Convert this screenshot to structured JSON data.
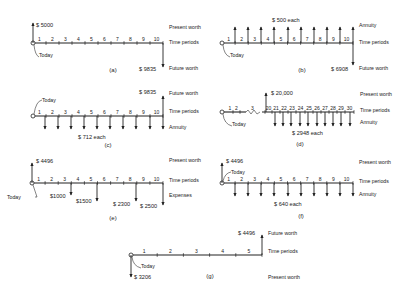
{
  "labels": {
    "present_worth": "Present worth",
    "future_worth": "Future worth",
    "time_periods": "Time periods",
    "annuity": "Annuity",
    "expenses": "Expenses",
    "today": "Today"
  },
  "diagrams": [
    {
      "id": "a",
      "caption": "(a)",
      "origin": [
        33,
        43
      ],
      "end": [
        163,
        43
      ],
      "ticks": [
        "1",
        "2",
        "3",
        "4",
        "5",
        "6",
        "7",
        "8",
        "9",
        "10"
      ],
      "arrows": [
        {
          "x": 33,
          "dir": "up",
          "len": 20,
          "label": "$ 5000",
          "lx": 36,
          "ly": 27
        },
        {
          "x": 163,
          "dir": "down",
          "len": 24,
          "label": "$ 9835",
          "lx": 139,
          "ly": 71
        }
      ],
      "right_labels": [
        {
          "text": "Present worth",
          "y": 29
        },
        {
          "text": "Time periods",
          "y": 44
        },
        {
          "text": "Future worth",
          "y": 70
        }
      ],
      "today": {
        "x": 38,
        "y": 57,
        "side": "below"
      },
      "caption_pos": [
        113,
        72
      ]
    },
    {
      "id": "b",
      "caption": "(b)",
      "origin": [
        222,
        43
      ],
      "end": [
        353,
        43
      ],
      "ticks": [
        "1",
        "2",
        "3",
        "4",
        "5",
        "6",
        "7",
        "8",
        "9",
        "10"
      ],
      "arrows": [
        {
          "x": 235,
          "dir": "up",
          "len": 16
        },
        {
          "x": 248,
          "dir": "up",
          "len": 16
        },
        {
          "x": 261,
          "dir": "up",
          "len": 16
        },
        {
          "x": 274,
          "dir": "up",
          "len": 16
        },
        {
          "x": 288,
          "dir": "up",
          "len": 16
        },
        {
          "x": 301,
          "dir": "up",
          "len": 16
        },
        {
          "x": 314,
          "dir": "up",
          "len": 16
        },
        {
          "x": 327,
          "dir": "up",
          "len": 16
        },
        {
          "x": 340,
          "dir": "up",
          "len": 16
        },
        {
          "x": 353,
          "dir": "up",
          "len": 16
        },
        {
          "x": 353,
          "dir": "down",
          "len": 22,
          "label": "$ 6908",
          "lx": 331,
          "ly": 71
        }
      ],
      "top_label": {
        "text": "$ 500 each",
        "x": 272,
        "y": 22
      },
      "right_labels": [
        {
          "text": "Annuity",
          "y": 27
        },
        {
          "text": "Time periods",
          "y": 44
        },
        {
          "text": "Future worth",
          "y": 70
        }
      ],
      "today": {
        "x": 229,
        "y": 57,
        "side": "below"
      },
      "caption_pos": [
        302,
        72
      ]
    },
    {
      "id": "c",
      "caption": "(c)",
      "origin": [
        33,
        116
      ],
      "end": [
        163,
        116
      ],
      "ticks": [
        "1",
        "2",
        "3",
        "4",
        "5",
        "6",
        "7",
        "8",
        "9",
        "10"
      ],
      "arrows": [
        {
          "x": 45,
          "dir": "down",
          "len": 13
        },
        {
          "x": 58,
          "dir": "down",
          "len": 13
        },
        {
          "x": 71,
          "dir": "down",
          "len": 13
        },
        {
          "x": 84,
          "dir": "down",
          "len": 13
        },
        {
          "x": 97,
          "dir": "down",
          "len": 13
        },
        {
          "x": 110,
          "dir": "down",
          "len": 13
        },
        {
          "x": 123,
          "dir": "down",
          "len": 13
        },
        {
          "x": 136,
          "dir": "down",
          "len": 13
        },
        {
          "x": 150,
          "dir": "down",
          "len": 13
        },
        {
          "x": 163,
          "dir": "down",
          "len": 13
        },
        {
          "x": 163,
          "dir": "up",
          "len": 20,
          "label": "$ 9835",
          "lx": 139,
          "ly": 94
        }
      ],
      "bottom_label": {
        "text": "$ 712 each",
        "x": 78,
        "y": 139
      },
      "right_labels": [
        {
          "text": "Future worth",
          "y": 95
        },
        {
          "text": "Time periods",
          "y": 113
        },
        {
          "text": "Annuity",
          "y": 129
        }
      ],
      "today": {
        "x": 43,
        "y": 101,
        "side": "above"
      },
      "caption_pos": [
        108,
        147
      ]
    },
    {
      "id": "d",
      "caption": "(d)",
      "origin": [
        222,
        112
      ],
      "end": [
        354,
        112
      ],
      "break": {
        "x1": 246,
        "x2": 262
      },
      "ticks": [
        "1",
        "2",
        "3",
        "20",
        "21",
        "22",
        "23",
        "24",
        "25",
        "26",
        "27",
        "28",
        "29",
        "30"
      ],
      "tick_x": [
        227,
        233,
        240,
        265,
        272,
        280,
        288,
        296,
        305,
        313,
        321,
        329,
        337,
        345,
        354
      ],
      "arrows": [
        {
          "x": 266,
          "dir": "up",
          "len": 19,
          "label": "$ 20,000",
          "lx": 271,
          "ly": 95
        },
        {
          "x": 275,
          "dir": "down",
          "len": 14
        },
        {
          "x": 283,
          "dir": "down",
          "len": 14
        },
        {
          "x": 291,
          "dir": "down",
          "len": 14
        },
        {
          "x": 300,
          "dir": "down",
          "len": 14
        },
        {
          "x": 308,
          "dir": "down",
          "len": 14
        },
        {
          "x": 317,
          "dir": "down",
          "len": 14
        },
        {
          "x": 325,
          "dir": "down",
          "len": 14
        },
        {
          "x": 333,
          "dir": "down",
          "len": 14
        },
        {
          "x": 341,
          "dir": "down",
          "len": 14
        },
        {
          "x": 350,
          "dir": "down",
          "len": 14
        }
      ],
      "bottom_label": {
        "text": "$ 2948 each",
        "x": 292,
        "y": 135
      },
      "right_labels": [
        {
          "text": "Present worth",
          "y": 96
        },
        {
          "text": "Time periods",
          "y": 112
        },
        {
          "text": "Annuity",
          "y": 124
        }
      ],
      "today": {
        "x": 231,
        "y": 126,
        "side": "below"
      },
      "caption_pos": [
        300,
        146
      ]
    },
    {
      "id": "e",
      "caption": "(e)",
      "origin": [
        32,
        183
      ],
      "end": [
        163,
        183
      ],
      "ticks": [
        "1",
        "2",
        "3",
        "4",
        "5",
        "6",
        "7",
        "8",
        "9",
        "10"
      ],
      "arrows": [
        {
          "x": 32,
          "dir": "up",
          "len": 20,
          "label": "$ 4496",
          "lx": 36,
          "ly": 163
        },
        {
          "x": 71,
          "dir": "down",
          "len": 12,
          "label": "$1000",
          "lx": 50,
          "ly": 198
        },
        {
          "x": 97,
          "dir": "down",
          "len": 18,
          "label": "$1500",
          "lx": 76,
          "ly": 203
        },
        {
          "x": 136,
          "dir": "down",
          "len": 18,
          "label": "$ 2300",
          "lx": 113,
          "ly": 206
        },
        {
          "x": 163,
          "dir": "down",
          "len": 22,
          "label": "$ 2500",
          "lx": 140,
          "ly": 208
        }
      ],
      "right_labels": [
        {
          "text": "Present worth",
          "y": 162
        },
        {
          "text": "Time periods",
          "y": 182
        },
        {
          "text": "Expenses",
          "y": 197
        }
      ],
      "today": {
        "x": 19,
        "y": 199,
        "side": "left"
      },
      "caption_pos": [
        113,
        220
      ]
    },
    {
      "id": "f",
      "caption": "(f)",
      "origin": [
        222,
        183
      ],
      "end": [
        353,
        183
      ],
      "ticks": [
        "1",
        "2",
        "3",
        "4",
        "5",
        "6",
        "7",
        "8",
        "9",
        "10"
      ],
      "arrows": [
        {
          "x": 222,
          "dir": "up",
          "len": 20,
          "label": "$ 4496",
          "lx": 226,
          "ly": 163
        },
        {
          "x": 235,
          "dir": "down",
          "len": 13
        },
        {
          "x": 248,
          "dir": "down",
          "len": 13
        },
        {
          "x": 261,
          "dir": "down",
          "len": 13
        },
        {
          "x": 274,
          "dir": "down",
          "len": 13
        },
        {
          "x": 288,
          "dir": "down",
          "len": 13
        },
        {
          "x": 301,
          "dir": "down",
          "len": 13
        },
        {
          "x": 314,
          "dir": "down",
          "len": 13
        },
        {
          "x": 327,
          "dir": "down",
          "len": 13
        },
        {
          "x": 340,
          "dir": "down",
          "len": 13
        },
        {
          "x": 353,
          "dir": "down",
          "len": 13
        }
      ],
      "bottom_label": {
        "text": "$ 640 each",
        "x": 274,
        "y": 206
      },
      "right_labels": [
        {
          "text": "Present worth",
          "y": 164
        },
        {
          "text": "Time periods",
          "y": 183
        },
        {
          "text": "Annuity",
          "y": 196
        }
      ],
      "today": {
        "x": 232,
        "y": 173,
        "side": "above"
      },
      "caption_pos": [
        301,
        218
      ]
    },
    {
      "id": "g",
      "caption": "(g)",
      "origin": [
        131,
        255
      ],
      "end": [
        262,
        255
      ],
      "ticks": [
        "1",
        "2",
        "3",
        "4",
        "5"
      ],
      "arrows": [
        {
          "x": 262,
          "dir": "up",
          "len": 20,
          "label": "$ 4496",
          "lx": 238,
          "ly": 235
        },
        {
          "x": 131,
          "dir": "down",
          "len": 22,
          "label": "$ 3206",
          "lx": 134,
          "ly": 279
        }
      ],
      "right_labels": [
        {
          "text": "Future worth",
          "y": 235
        },
        {
          "text": "Time periods",
          "y": 253
        },
        {
          "text": "Present worth",
          "y": 279
        }
      ],
      "today": {
        "x": 140,
        "y": 268,
        "side": "below"
      },
      "caption_pos": [
        210,
        278
      ]
    }
  ]
}
